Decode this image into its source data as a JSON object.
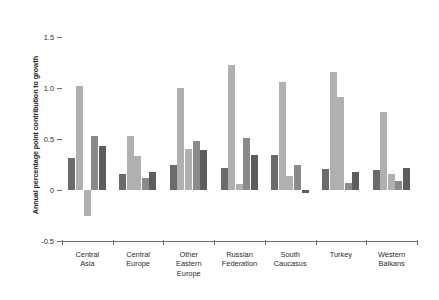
{
  "chart_data": {
    "type": "bar",
    "title": "",
    "xlabel": "",
    "ylabel": "Annual percentage point contribution to growth",
    "ylim": [
      -0.5,
      1.5
    ],
    "yticks": [
      1.5,
      1.0,
      0.5,
      0,
      -0.5
    ],
    "ytick_labels": [
      "1.5",
      "1.0",
      "0.5",
      "0",
      "-0.5"
    ],
    "grid": false,
    "legend": "none",
    "categories": [
      "Central Asia",
      "Central Europe",
      "Other Eastern Europe",
      "Russian Federation",
      "South Caucasus",
      "Turkey",
      "Western Balkans"
    ],
    "category_lines": [
      [
        "Central",
        "Asia"
      ],
      [
        "Central",
        "Europe"
      ],
      [
        "Other",
        "Eastern",
        "Europe"
      ],
      [
        "Russian",
        "Federation"
      ],
      [
        "South",
        "Caucasus"
      ],
      [
        "Turkey"
      ],
      [
        "Western",
        "Balkans"
      ]
    ],
    "series": [
      {
        "name": "series-1",
        "color": "#6b6b6b",
        "values": [
          0.31,
          0.16,
          0.25,
          0.22,
          0.34,
          0.21,
          0.2
        ]
      },
      {
        "name": "series-2",
        "color": "#b0b0b0",
        "values": [
          1.02,
          0.53,
          1.0,
          1.23,
          1.06,
          1.16,
          0.76
        ]
      },
      {
        "name": "series-3",
        "color": "#b0b0b0",
        "values": [
          -0.25,
          0.33,
          0.4,
          0.06,
          0.14,
          0.91,
          0.16
        ]
      },
      {
        "name": "series-4",
        "color": "#8a8a8a",
        "values": [
          0.53,
          0.12,
          0.48,
          0.51,
          0.25,
          0.07,
          0.09
        ]
      },
      {
        "name": "series-5",
        "color": "#5d5d5d",
        "values": [
          0.43,
          0.18,
          0.39,
          0.34,
          -0.03,
          0.18,
          0.22
        ]
      }
    ]
  },
  "axis": {
    "y_title": "Annual percentage point contribution to growth"
  },
  "colors": {
    "axis": "#6e6e6e",
    "zero_line": "#c9c9c9",
    "background": "#ffffff",
    "text": "#2b2b2b"
  }
}
